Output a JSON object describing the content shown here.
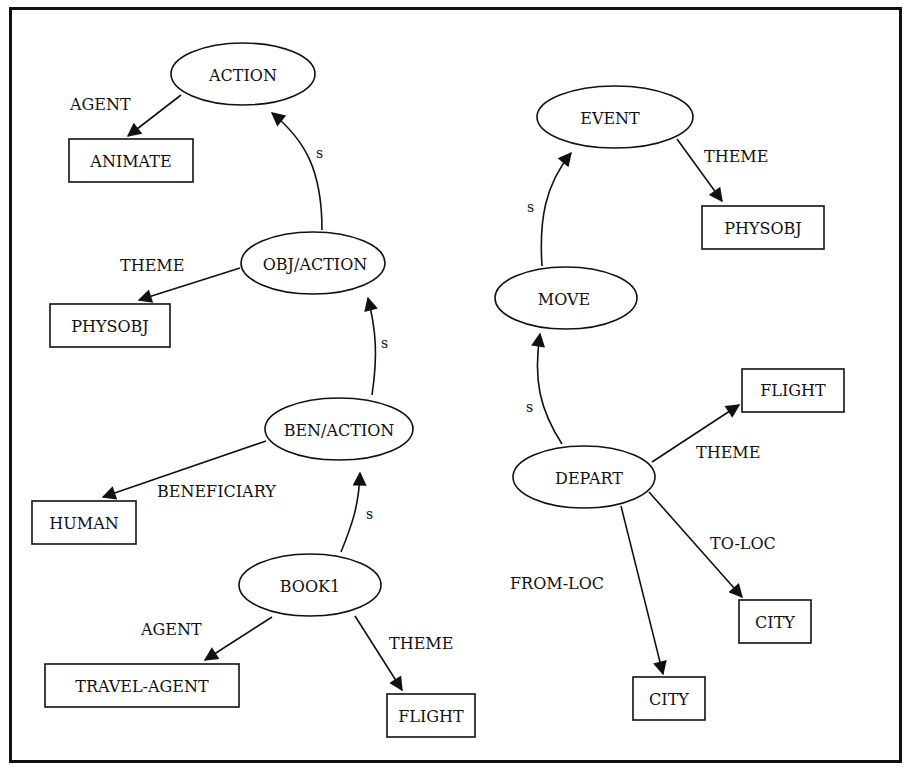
{
  "diagram": {
    "type": "semantic-network",
    "left_network": {
      "ellipses": [
        {
          "id": "action",
          "label": "ACTION",
          "cx": 243,
          "cy": 74,
          "rx": 72,
          "ry": 31
        },
        {
          "id": "obj_action",
          "label": "OBJ/ACTION",
          "cx": 313,
          "cy": 263,
          "rx": 72,
          "ry": 31
        },
        {
          "id": "ben_action",
          "label": "BEN/ACTION",
          "cx": 339,
          "cy": 429,
          "rx": 74,
          "ry": 31
        },
        {
          "id": "book1",
          "label": "BOOK1",
          "cx": 310,
          "cy": 585,
          "rx": 71,
          "ry": 31
        }
      ],
      "boxes": [
        {
          "id": "animate",
          "label": "ANIMATE",
          "x": 69,
          "y": 139,
          "w": 124,
          "h": 43
        },
        {
          "id": "physobj_l",
          "label": "PHYSOBJ",
          "x": 50,
          "y": 304,
          "w": 120,
          "h": 43
        },
        {
          "id": "human",
          "label": "HUMAN",
          "x": 32,
          "y": 501,
          "w": 104,
          "h": 43
        },
        {
          "id": "travel_agent",
          "label": "TRAVEL-AGENT",
          "x": 45,
          "y": 664,
          "w": 194,
          "h": 43
        },
        {
          "id": "flight_l",
          "label": "FLIGHT",
          "x": 387,
          "y": 694,
          "w": 88,
          "h": 43
        }
      ],
      "edges": [
        {
          "from": "action",
          "to": "animate",
          "label": "AGENT"
        },
        {
          "from": "obj_action",
          "to": "action",
          "label": "S"
        },
        {
          "from": "obj_action",
          "to": "physobj_l",
          "label": "THEME"
        },
        {
          "from": "ben_action",
          "to": "obj_action",
          "label": "S"
        },
        {
          "from": "ben_action",
          "to": "human",
          "label": "BENEFICIARY"
        },
        {
          "from": "book1",
          "to": "ben_action",
          "label": "S"
        },
        {
          "from": "book1",
          "to": "travel_agent",
          "label": "AGENT"
        },
        {
          "from": "book1",
          "to": "flight_l",
          "label": "THEME"
        }
      ]
    },
    "right_network": {
      "ellipses": [
        {
          "id": "event",
          "label": "EVENT",
          "cx": 615,
          "cy": 117,
          "rx": 78,
          "ry": 31
        },
        {
          "id": "move",
          "label": "MOVE",
          "cx": 566,
          "cy": 298,
          "rx": 71,
          "ry": 31
        },
        {
          "id": "depart",
          "label": "DEPART",
          "cx": 584,
          "cy": 477,
          "rx": 71,
          "ry": 31
        }
      ],
      "boxes": [
        {
          "id": "physobj_r",
          "label": "PHYSOBJ",
          "x": 702,
          "y": 206,
          "w": 122,
          "h": 43
        },
        {
          "id": "flight_r",
          "label": "FLIGHT",
          "x": 742,
          "y": 369,
          "w": 102,
          "h": 43
        },
        {
          "id": "city_to",
          "label": "CITY",
          "x": 739,
          "y": 600,
          "w": 72,
          "h": 43
        },
        {
          "id": "city_from",
          "label": "CITY",
          "x": 633,
          "y": 677,
          "w": 72,
          "h": 43
        }
      ],
      "edges": [
        {
          "from": "move",
          "to": "event",
          "label": "S"
        },
        {
          "from": "event",
          "to": "physobj_r",
          "label": "THEME"
        },
        {
          "from": "depart",
          "to": "move",
          "label": "S"
        },
        {
          "from": "depart",
          "to": "flight_r",
          "label": "THEME"
        },
        {
          "from": "depart",
          "to": "city_to",
          "label": "TO-LOC"
        },
        {
          "from": "depart",
          "to": "city_from",
          "label": "FROM-LOC"
        }
      ]
    },
    "edge_labels": {
      "agent_top": "AGENT",
      "s1": "S",
      "theme_obj": "THEME",
      "s2": "S",
      "beneficiary": "BENEFICIARY",
      "s3": "S",
      "agent_book": "AGENT",
      "theme_book": "THEME",
      "s_move_event": "S",
      "theme_event": "THEME",
      "s_depart_move": "S",
      "theme_depart": "THEME",
      "to_loc": "TO-LOC",
      "from_loc": "FROM-LOC"
    },
    "colors": {
      "stroke": "#111111",
      "background": "#ffffff"
    }
  }
}
